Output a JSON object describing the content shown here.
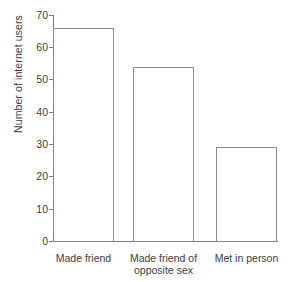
{
  "chart_data": {
    "type": "bar",
    "title": "",
    "xlabel": "",
    "ylabel": "Number of internet users",
    "categories": [
      "Made friend",
      "Made friend of\nopposite sex",
      "Met in person"
    ],
    "values": [
      66,
      54,
      29
    ],
    "ylim": [
      0,
      70
    ],
    "yticks": [
      0,
      10,
      20,
      30,
      40,
      50,
      60,
      70
    ],
    "ytick_labels": [
      "0",
      "10",
      "20",
      "30",
      "40",
      "50",
      "60",
      "70"
    ],
    "grid": false,
    "legend": false,
    "bar_fill_color": "#ffffff",
    "bar_edge_color": "#8a8a8a",
    "axis_color": "#7d7d7d",
    "text_color": "#404040",
    "background_color": "#ffffff"
  }
}
